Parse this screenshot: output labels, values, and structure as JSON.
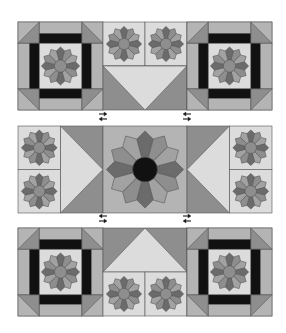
{
  "figure": {
    "colors": {
      "background": "#ffffff",
      "light": "#dcdcdc",
      "light_strip": "#b4b4b4",
      "mid": "#8e8e8e",
      "dark": "#6b6b6b",
      "petal_light": "#a2a2a2",
      "black": "#111111",
      "seam": "#555555"
    },
    "rows": [
      {
        "name": "top-row",
        "blocks": [
          "corner-star-block",
          "plates-over-geese-down",
          "corner-star-block"
        ]
      },
      {
        "name": "middle-row",
        "blocks": [
          "plates-with-geese-right",
          "large-dresden-plate",
          "geese-left-with-plates"
        ]
      },
      {
        "name": "bottom-row",
        "blocks": [
          "corner-star-block",
          "geese-up-over-plates",
          "corner-star-block"
        ]
      }
    ],
    "arrows": [
      {
        "position": "between-top-and-middle-left",
        "directions": [
          "right",
          "left"
        ]
      },
      {
        "position": "between-top-and-middle-right",
        "directions": [
          "left",
          "right"
        ]
      },
      {
        "position": "between-middle-and-bottom-left",
        "directions": [
          "left",
          "right"
        ]
      },
      {
        "position": "between-middle-and-bottom-right",
        "directions": [
          "right",
          "left"
        ]
      }
    ]
  }
}
